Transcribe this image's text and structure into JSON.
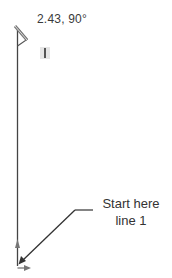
{
  "diagram": {
    "dimension_readout": "2.43, 90°",
    "callout": {
      "line1": "Start here",
      "line2": "line 1"
    },
    "icons": {
      "pencil": "pencil-cursor-icon",
      "text_cursor": "text-cursor-icon",
      "axis_up": "axis-arrow-up-icon",
      "axis_right": "axis-arrow-right-icon"
    },
    "colors": {
      "line": "#444444",
      "text": "#333333",
      "marker_bg": "#e6e6e6"
    }
  }
}
